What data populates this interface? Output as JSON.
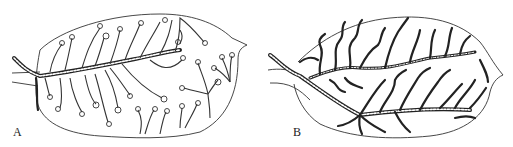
{
  "figure": {
    "panels": [
      {
        "id": "A",
        "label": "A",
        "subject": "leaf with branched veins ending in spiral curls"
      },
      {
        "id": "B",
        "label": "B",
        "subject": "leaf with branched veins ending in wavy free tips"
      }
    ],
    "colors": {
      "ink": "#222222",
      "background": "#ffffff"
    }
  }
}
